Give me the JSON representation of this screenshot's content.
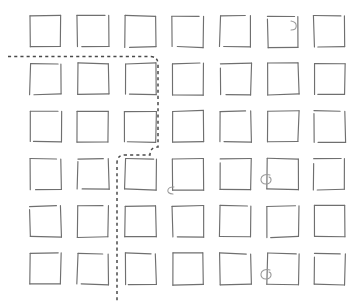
{
  "figure": {
    "title": "",
    "background_color": "#ffffff",
    "width": 356,
    "height": 303,
    "style": "hand-drawn sketch"
  },
  "grid": {
    "rows": 6,
    "cols": 7,
    "cell_size": 31,
    "col_x": [
      30,
      77.5,
      125,
      172.5,
      220,
      267.5,
      314
    ],
    "row_y": [
      16,
      63.5,
      111,
      158.5,
      206,
      253.5
    ],
    "stroke_color": "#6f6f6f",
    "stroke_width": 1.15,
    "fill": "none"
  },
  "route": {
    "name": "dashed-route-path",
    "stroke_color": "#4a4a4a",
    "stroke_width": 1.5,
    "dash_pattern": "3.1 3.1",
    "corner_radius": 7,
    "waypoints": [
      {
        "x": 8,
        "y": 56.5
      },
      {
        "x": 150,
        "y": 56.5
      },
      {
        "x": 158,
        "y": 64.5
      },
      {
        "x": 158,
        "y": 147
      },
      {
        "x": 150,
        "y": 155
      },
      {
        "x": 125,
        "y": 155
      },
      {
        "x": 117,
        "y": 163
      },
      {
        "x": 117,
        "y": 303
      }
    ],
    "segments": [
      {
        "orientation": "horizontal",
        "from_x": 8,
        "to_x": 150,
        "y": 56.5
      },
      {
        "orientation": "vertical",
        "x": 158,
        "from_y": 64.5,
        "to_y": 147
      },
      {
        "orientation": "horizontal",
        "from_x": 150,
        "to_x": 125,
        "y": 155
      },
      {
        "orientation": "vertical",
        "x": 117,
        "from_y": 163,
        "to_y": 303
      }
    ]
  },
  "annotations": {
    "label": "pen-curl-marks",
    "marks": [
      {
        "id": "curl-r1c6",
        "row": 1,
        "col": 6,
        "side": "right-top",
        "type": "notch",
        "cx": 292,
        "cy": 27
      },
      {
        "id": "curl-r4c4",
        "row": 4,
        "col": 4,
        "side": "bottom-left",
        "type": "hook",
        "cx": 172,
        "cy": 189
      },
      {
        "id": "curl-r4c6",
        "row": 4,
        "col": 6,
        "side": "left-middle",
        "type": "loop",
        "cx": 266,
        "cy": 179
      },
      {
        "id": "curl-r6c6",
        "row": 6,
        "col": 6,
        "side": "left-middle",
        "type": "loop",
        "cx": 266,
        "cy": 274
      }
    ]
  },
  "chart_data": {
    "type": "diagram",
    "title": "",
    "elements": {
      "squares": 42,
      "dashed_path_count": 1,
      "curl_marks": 4
    }
  }
}
